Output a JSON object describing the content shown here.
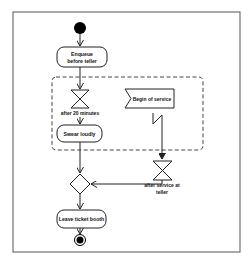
{
  "diagram": {
    "type": "uml-activity",
    "colors": {
      "stroke": "#222222",
      "frame": "#555555",
      "dashed_region": "#444444",
      "fill": "#ffffff",
      "node_fill": "#000000"
    },
    "nodes": {
      "start": {
        "kind": "initial-node"
      },
      "enqueue": {
        "kind": "action",
        "label_line1": "Enqueue",
        "label_line2": "before teller"
      },
      "timer_20": {
        "kind": "time-event",
        "label": "after 20 minutes"
      },
      "swear": {
        "kind": "action",
        "label": "Swear loudly"
      },
      "begin_service": {
        "kind": "accept-event",
        "label": "Begin of service"
      },
      "timer_service": {
        "kind": "time-event",
        "label_line1": "after service at",
        "label_line2": "teller"
      },
      "merge": {
        "kind": "decision-merge"
      },
      "leave": {
        "kind": "action",
        "label": "Leave ticket booth"
      },
      "end": {
        "kind": "final-node"
      }
    },
    "regions": [
      {
        "kind": "interruptible-activity-region",
        "contains": [
          "timer_20",
          "swear",
          "begin_service"
        ]
      }
    ],
    "edges": [
      {
        "from": "start",
        "to": "enqueue"
      },
      {
        "from": "enqueue",
        "to": "timer_20"
      },
      {
        "from": "timer_20",
        "to": "swear"
      },
      {
        "from": "swear",
        "to": "merge"
      },
      {
        "from": "begin_service",
        "to": "timer_service",
        "kind": "interrupting"
      },
      {
        "from": "timer_service",
        "to": "merge"
      },
      {
        "from": "merge",
        "to": "leave"
      },
      {
        "from": "leave",
        "to": "end"
      }
    ]
  }
}
